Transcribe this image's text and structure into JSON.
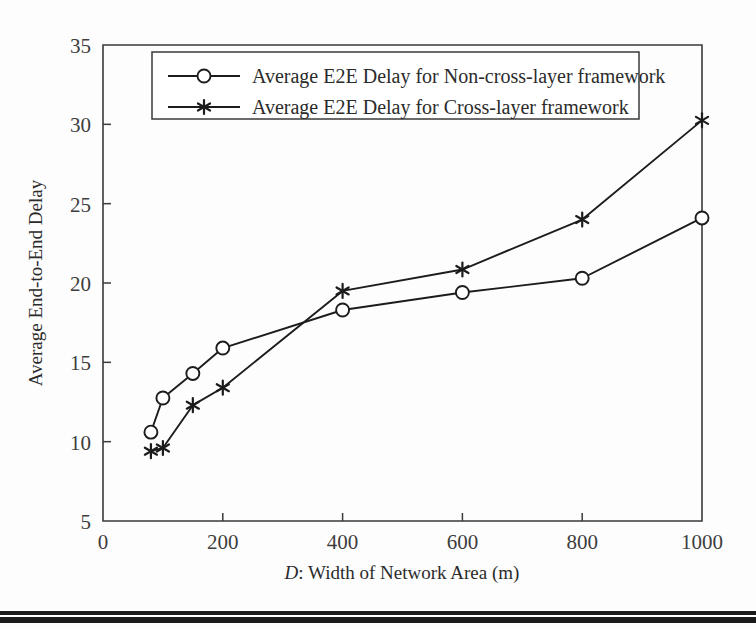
{
  "figure": {
    "background_color": "#fdfdfd",
    "line_color": "#1c1c1c",
    "axis_color": "#3a3a3a",
    "text_color": "#2b2b2b"
  },
  "chart_data": {
    "type": "line",
    "title": "",
    "xlabel_prefix": "D",
    "xlabel_suffix": ": Width of Network Area (m)",
    "xlabel": "D: Width of Network Area (m)",
    "ylabel": "Average End-to-End Delay",
    "xlim": [
      0,
      1000
    ],
    "ylim": [
      5,
      35
    ],
    "xticks": [
      0,
      200,
      400,
      600,
      800,
      1000
    ],
    "xticklabels": [
      "0",
      "200",
      "400",
      "600",
      "800",
      "1000"
    ],
    "yticks": [
      5,
      10,
      15,
      20,
      25,
      30,
      35
    ],
    "yticklabels": [
      "5",
      "10",
      "15",
      "20",
      "25",
      "30",
      "35"
    ],
    "grid": false,
    "legend_position": "upper center",
    "series": [
      {
        "name": "Average E2E Delay for Non-cross-layer framework",
        "marker": "circle",
        "x": [
          80,
          100,
          150,
          200,
          400,
          600,
          800,
          1000
        ],
        "values": [
          10.6,
          12.75,
          14.3,
          15.9,
          18.3,
          19.4,
          20.3,
          24.1
        ]
      },
      {
        "name": "Average E2E Delay for Cross-layer framework",
        "marker": "star",
        "x": [
          80,
          100,
          150,
          200,
          400,
          600,
          800,
          1000
        ],
        "values": [
          9.4,
          9.6,
          12.3,
          13.4,
          19.5,
          20.85,
          24.0,
          30.25
        ]
      }
    ]
  },
  "legend": {
    "entries": [
      {
        "label": "Average E2E Delay for Non-cross-layer framework",
        "marker": "circle"
      },
      {
        "label": "Average E2E Delay for Cross-layer framework",
        "marker": "star"
      }
    ]
  }
}
